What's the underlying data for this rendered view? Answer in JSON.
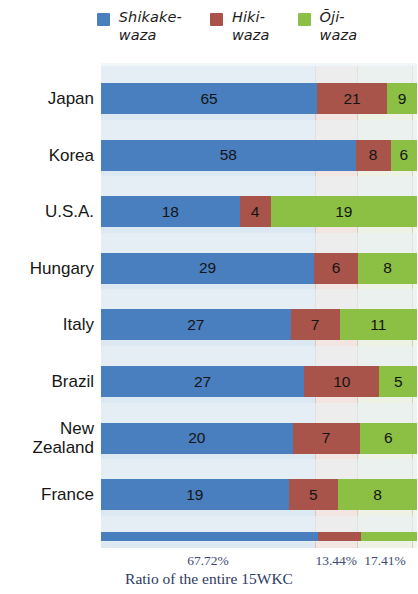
{
  "legend": {
    "items": [
      {
        "label": "Shikake-\nwaza",
        "color": "#4a7fbf",
        "icon": "legend-swatch-blue"
      },
      {
        "label": "Hiki-\nwaza",
        "color": "#a8544a",
        "icon": "legend-swatch-brown"
      },
      {
        "label": "Ōji-\nwaza",
        "color": "#8cc044",
        "icon": "legend-swatch-green"
      }
    ]
  },
  "axis": {
    "percent_labels": [
      "67.72%",
      "13.44%",
      "17.41%"
    ],
    "caption": "Ratio of the entire 15WKC"
  },
  "chart_data": {
    "type": "bar",
    "title": "",
    "subtitle": "",
    "orientation": "horizontal",
    "stacked": true,
    "normalized": true,
    "xlabel": "Ratio of the entire 15WKC",
    "ylabel": "",
    "xlim": [
      0,
      100
    ],
    "grid": false,
    "legend_position": "top",
    "categories": [
      "Japan",
      "Korea",
      "U.S.A.",
      "Hungary",
      "Italy",
      "Brazil",
      "New\nZealand",
      "France"
    ],
    "series": [
      {
        "name": "Shikake-waza",
        "color": "#4a7fbf",
        "values": [
          65,
          58,
          18,
          29,
          27,
          27,
          20,
          19
        ]
      },
      {
        "name": "Hiki-waza",
        "color": "#a8544a",
        "values": [
          21,
          8,
          4,
          6,
          7,
          10,
          7,
          5
        ]
      },
      {
        "name": "Ōji-waza",
        "color": "#8cc044",
        "values": [
          9,
          6,
          19,
          8,
          11,
          5,
          6,
          8
        ]
      }
    ],
    "totals_percent": {
      "Shikake-waza": 67.72,
      "Hiki-waza": 13.44,
      "Ōji-waza": 17.41
    },
    "annotations": [
      "67.72%",
      "13.44%",
      "17.41%"
    ]
  }
}
